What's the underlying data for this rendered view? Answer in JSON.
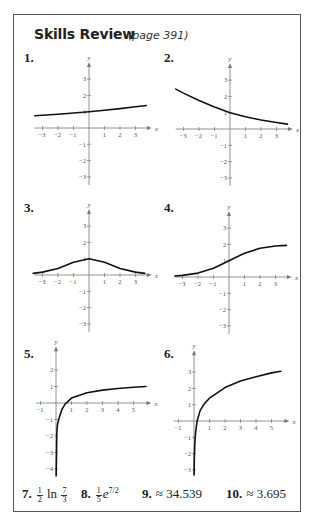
{
  "header": {
    "title": "Skills Review",
    "subtitle": "(page 391)"
  },
  "problems": [
    {
      "label": "1."
    },
    {
      "label": "2."
    },
    {
      "label": "3."
    },
    {
      "label": "4."
    },
    {
      "label": "5."
    },
    {
      "label": "6."
    }
  ],
  "answers": [
    {
      "label": "7.",
      "coef_num": "1",
      "coef_den": "2",
      "fn": "ln",
      "arg_num": "7",
      "arg_den": "3"
    },
    {
      "label": "8.",
      "coef_num": "1",
      "coef_den": "5",
      "base": "e",
      "exponent": "7/2"
    },
    {
      "label": "9.",
      "approx": "≈",
      "value": "34.539"
    },
    {
      "label": "10.",
      "approx": "≈",
      "value": "3.695"
    }
  ],
  "chart_data": [
    {
      "id": 1,
      "type": "line",
      "title": "1.",
      "xlabel": "x",
      "ylabel": "y",
      "xticks": [
        -3,
        -2,
        -1,
        1,
        2,
        3
      ],
      "yticks": [
        -3,
        -2,
        -1,
        1,
        2,
        3
      ],
      "xlim": [
        -3.5,
        3.8
      ],
      "ylim": [
        -3.5,
        3.8
      ],
      "grid": false,
      "x": [
        -3.5,
        -3,
        -2,
        -1,
        0,
        1,
        2,
        3,
        3.7
      ],
      "y": [
        0.75,
        0.78,
        0.84,
        0.92,
        1.0,
        1.09,
        1.19,
        1.3,
        1.38
      ]
    },
    {
      "id": 2,
      "type": "line",
      "title": "2.",
      "xlabel": "x",
      "ylabel": "y",
      "xticks": [
        -3,
        -2,
        -1,
        1,
        2,
        3
      ],
      "yticks": [
        -3,
        -2,
        -1,
        1,
        2,
        3
      ],
      "xlim": [
        -3.5,
        3.8
      ],
      "ylim": [
        -3.5,
        3.8
      ],
      "grid": false,
      "x": [
        -3.5,
        -3,
        -2,
        -1,
        0,
        1,
        2,
        3,
        3.7
      ],
      "y": [
        2.45,
        2.2,
        1.75,
        1.35,
        1.0,
        0.75,
        0.55,
        0.4,
        0.3
      ]
    },
    {
      "id": 3,
      "type": "line",
      "title": "3.",
      "xlabel": "x",
      "ylabel": "y",
      "xticks": [
        -3,
        -2,
        -1,
        1,
        2,
        3
      ],
      "yticks": [
        -3,
        -2,
        -1,
        1,
        2,
        3
      ],
      "xlim": [
        -3.5,
        3.8
      ],
      "ylim": [
        -3.5,
        3.8
      ],
      "grid": false,
      "x": [
        -3.6,
        -3,
        -2,
        -1,
        0,
        1,
        2,
        3,
        3.6
      ],
      "y": [
        0.1,
        0.18,
        0.4,
        0.78,
        1.0,
        0.78,
        0.4,
        0.18,
        0.1
      ]
    },
    {
      "id": 4,
      "type": "line",
      "title": "4.",
      "xlabel": "x",
      "ylabel": "y",
      "xticks": [
        -3,
        -2,
        -1,
        1,
        2,
        3
      ],
      "yticks": [
        -3,
        -2,
        -1,
        1,
        2,
        3
      ],
      "xlim": [
        -3.5,
        3.8
      ],
      "ylim": [
        -3.5,
        3.8
      ],
      "grid": false,
      "x": [
        -3.5,
        -3,
        -2,
        -1,
        0,
        1,
        2,
        3,
        3.7
      ],
      "y": [
        0.06,
        0.1,
        0.24,
        0.54,
        1.0,
        1.46,
        1.76,
        1.9,
        1.94
      ]
    },
    {
      "id": 5,
      "type": "line",
      "title": "5.",
      "xlabel": "x",
      "ylabel": "y",
      "xticks": [
        -1,
        1,
        2,
        3,
        4,
        5
      ],
      "yticks": [
        -4,
        -3,
        -2,
        -1,
        1,
        2
      ],
      "xlim": [
        -1.3,
        5.9
      ],
      "ylim": [
        -4.5,
        3.2
      ],
      "grid": false,
      "x": [
        0.01,
        0.05,
        0.1,
        0.2,
        0.4,
        0.6,
        1,
        2,
        3,
        4,
        5,
        5.8
      ],
      "y": [
        -4.4,
        -1.8,
        -1.3,
        -0.9,
        -0.35,
        -0.05,
        0.3,
        0.62,
        0.78,
        0.88,
        0.95,
        1.0
      ]
    },
    {
      "id": 6,
      "type": "line",
      "title": "6.",
      "xlabel": "x",
      "ylabel": "y",
      "xticks": [
        -1,
        1,
        2,
        3,
        4,
        5
      ],
      "yticks": [
        -3,
        -2,
        -1,
        1,
        2,
        3
      ],
      "xlim": [
        -1.3,
        5.9
      ],
      "ylim": [
        -3.4,
        4.1
      ],
      "grid": false,
      "x": [
        0.005,
        0.02,
        0.05,
        0.1,
        0.2,
        0.4,
        0.7,
        1,
        2,
        3,
        4,
        5,
        5.6
      ],
      "y": [
        -3.3,
        -2.3,
        -1.4,
        -0.7,
        0.0,
        0.65,
        1.1,
        1.4,
        2.05,
        2.45,
        2.72,
        2.95,
        3.05
      ]
    }
  ]
}
